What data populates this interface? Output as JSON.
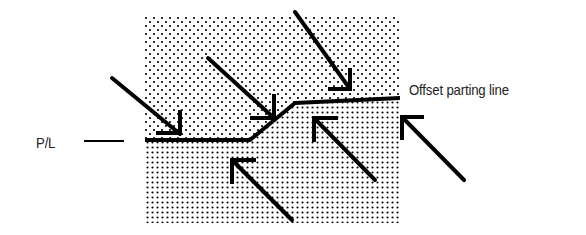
{
  "diagram": {
    "labels": {
      "parting_line": "P/L",
      "offset": "Offset parting line"
    },
    "colors": {
      "ink": "#000000",
      "background": "#ffffff",
      "text": "#222222"
    },
    "regions": {
      "upper_mold_half": {
        "fill": "sparse-dot-pattern",
        "x": [
          145,
          400
        ],
        "y_top": 15
      },
      "lower_mold_half": {
        "fill": "dense-dot-pattern",
        "x": [
          145,
          400
        ],
        "y_bottom": 223
      }
    },
    "parting_line_path": [
      [
        145,
        140
      ],
      [
        250,
        140
      ],
      [
        295,
        103
      ],
      [
        400,
        98
      ]
    ],
    "arrows_down": [
      {
        "from": [
          112,
          78
        ],
        "to": [
          180,
          134
        ]
      },
      {
        "from": [
          208,
          58
        ],
        "to": [
          275,
          116
        ]
      },
      {
        "from": [
          295,
          10
        ],
        "to": [
          352,
          90
        ]
      }
    ],
    "arrows_up": [
      {
        "from": [
          290,
          218
        ],
        "to": [
          232,
          160
        ]
      },
      {
        "from": [
          375,
          178
        ],
        "to": [
          315,
          118
        ]
      },
      {
        "from": [
          465,
          180
        ],
        "to": [
          402,
          116
        ]
      }
    ]
  }
}
